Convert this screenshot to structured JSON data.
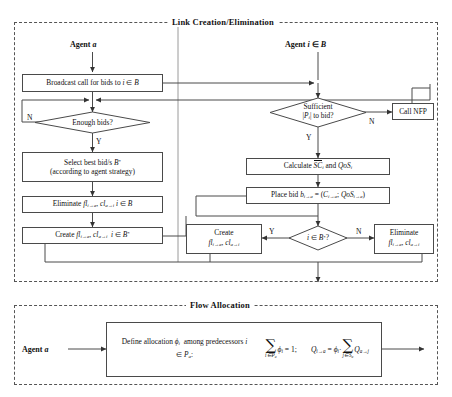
{
  "figure": {
    "type": "flowchart",
    "panels": [
      {
        "id": "link",
        "title": "Link Creation/Elimination"
      },
      {
        "id": "flow",
        "title": "Flow Allocation"
      }
    ]
  },
  "link_panel": {
    "title": "Link Creation/Elimination",
    "columns": [
      {
        "id": "agent-a",
        "label_plain": "Agent a"
      },
      {
        "id": "agent-i",
        "label_plain": "Agent i ∈ B"
      }
    ],
    "nodes": {
      "broadcast": "Broadcast call for bids to i ∈ B",
      "enough_bids": "Enough bids?",
      "select_best_line1": "Select best bid/s B*",
      "select_best_line2": "(according to agent strategy)",
      "eliminate_left": "Eliminate fl(i→a), cl(a→i) i ∈ B",
      "create_left": "Create fl(i→a), cl(a→i) i ∈ B*",
      "sufficient_line1": "Sufficient",
      "sufficient_line2": "|Pi| to bid?",
      "call_nfp": "Call NFP",
      "calculate": "Calculate SC̄i and QoSi",
      "place_bid": "Place bid b(i→a) = (C(i→a); QoS(i→a))",
      "decision_inB": "i ∈ B*?",
      "create_right_line1": "Create",
      "create_right_line2": "fl(i→a), cl(a→i)",
      "eliminate_right_line1": "Eliminate",
      "eliminate_right_line2": "fl(i→a), cl(a→i)"
    },
    "branch_labels": {
      "enough_bids_no": "N",
      "enough_bids_yes": "Y",
      "sufficient_no": "N",
      "sufficient_yes": "Y",
      "inB_yes": "Y",
      "inB_no": "N"
    }
  },
  "flow_panel": {
    "title": "Flow Allocation",
    "agent_label_plain": "Agent a",
    "description_line1": "Define allocation ϖi among",
    "description_line2": "predecessors i ∈ Pa:",
    "formula_1": "∑(i∈Pa) ϖi = 1;",
    "formula_2": "Q(i→a) = ϖi · ∑(j∈Sa) Q(a→j)"
  },
  "style": {
    "line_color": "#4a4a4a",
    "dash_color": "#555555",
    "background": "#ffffff",
    "text_color": "#111111"
  }
}
